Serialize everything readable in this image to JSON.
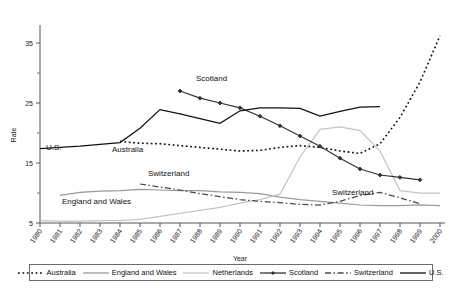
{
  "chart_data": {
    "type": "line",
    "title": "",
    "xlabel": "Year",
    "ylabel": "Rate",
    "xlim": [
      1980,
      2000
    ],
    "ylim": [
      5,
      38
    ],
    "yticks": [
      5,
      15,
      25,
      35
    ],
    "yminor": [
      10,
      20,
      30
    ],
    "grid": false,
    "legend_position": "bottom",
    "x": [
      1980,
      1981,
      1982,
      1983,
      1984,
      1985,
      1986,
      1987,
      1988,
      1989,
      1990,
      1991,
      1992,
      1993,
      1994,
      1995,
      1996,
      1997,
      1998,
      1999,
      2000
    ],
    "series": [
      {
        "name": "Australia",
        "style": "dotted",
        "color": "#111111",
        "marker": "none",
        "x": [
          1984,
          1985,
          1986,
          1987,
          1988,
          1989,
          1990,
          1991,
          1992,
          1993,
          1994,
          1995,
          1996,
          1997,
          1998,
          1999,
          2000
        ],
        "values": [
          18.6,
          18.3,
          18.2,
          17.9,
          17.6,
          17.3,
          17.0,
          17.1,
          17.6,
          17.9,
          17.6,
          17.0,
          16.6,
          18.2,
          22.6,
          28.5,
          36.2
        ]
      },
      {
        "name": "England and Wales",
        "style": "solid",
        "color": "#9a9a9a",
        "marker": "none",
        "x": [
          1981,
          1982,
          1983,
          1984,
          1985,
          1986,
          1987,
          1988,
          1989,
          1990,
          1991,
          1992,
          1993,
          1994,
          1995,
          1996,
          1997,
          1998,
          1999,
          2000
        ],
        "values": [
          9.6,
          10.1,
          10.3,
          10.4,
          10.6,
          10.5,
          10.4,
          10.4,
          10.2,
          10.1,
          9.9,
          9.3,
          8.9,
          8.6,
          8.3,
          8.0,
          7.9,
          7.9,
          8.0,
          7.9
        ]
      },
      {
        "name": "Netherlands",
        "style": "solid",
        "color": "#c4c4c4",
        "marker": "none",
        "x": [
          1980,
          1981,
          1982,
          1983,
          1984,
          1985,
          1986,
          1987,
          1988,
          1989,
          1990,
          1991,
          1992,
          1993,
          1994,
          1995,
          1996,
          1997,
          1998,
          1999,
          2000
        ],
        "values": [
          5.4,
          5.3,
          5.3,
          5.4,
          5.4,
          5.6,
          6.1,
          6.6,
          7.1,
          7.6,
          8.3,
          8.9,
          9.8,
          16.0,
          20.6,
          21.0,
          20.4,
          17.0,
          10.4,
          10.0,
          10.0
        ]
      },
      {
        "name": "Scotland",
        "style": "solid-marker",
        "color": "#333333",
        "marker": "diamond",
        "x": [
          1987,
          1988,
          1989,
          1990,
          1991,
          1992,
          1993,
          1994,
          1995,
          1996,
          1997,
          1998,
          1999
        ],
        "values": [
          27.0,
          25.8,
          25.0,
          24.2,
          22.8,
          21.2,
          19.5,
          17.8,
          15.8,
          14.0,
          13.0,
          12.6,
          12.2
        ]
      },
      {
        "name": "Switzerland",
        "style": "dashdot",
        "color": "#4a4a4a",
        "marker": "none",
        "x": [
          1985,
          1986,
          1987,
          1988,
          1989,
          1990,
          1991,
          1992,
          1993,
          1994,
          1995,
          1996,
          1997,
          1998,
          1999
        ],
        "values": [
          11.5,
          11.0,
          10.5,
          9.9,
          9.4,
          8.9,
          8.6,
          8.4,
          8.1,
          8.0,
          8.6,
          9.6,
          10.1,
          9.2,
          8.2
        ]
      },
      {
        "name": "U.S.",
        "style": "solid",
        "color": "#111111",
        "marker": "none",
        "x": [
          1980,
          1981,
          1982,
          1983,
          1984,
          1985,
          1986,
          1987,
          1988,
          1989,
          1990,
          1991,
          1992,
          1993,
          1994,
          1995,
          1996,
          1997
        ],
        "values": [
          17.4,
          17.6,
          17.8,
          18.1,
          18.4,
          20.8,
          23.9,
          23.2,
          22.4,
          21.6,
          23.7,
          24.2,
          24.2,
          24.1,
          22.8,
          23.6,
          24.3,
          24.4
        ]
      }
    ],
    "annotations": [
      {
        "text": "U.S.",
        "x": 1980.3,
        "y": 17.1
      },
      {
        "text": "Australia",
        "x": 1983.6,
        "y": 16.8
      },
      {
        "text": "Scotland",
        "x": 1987.8,
        "y": 28.6
      },
      {
        "text": "Switzerland",
        "x": 1985.4,
        "y": 12.9
      },
      {
        "text": "Switzerland",
        "x": 1994.6,
        "y": 9.6
      },
      {
        "text": "England and Wales",
        "x": 1981.1,
        "y": 8.2
      }
    ],
    "xtick_labels": [
      "1980",
      "1981",
      "1982",
      "1983",
      "1984",
      "1985",
      "1986",
      "1987",
      "1988",
      "1989",
      "1990",
      "1991",
      "1992",
      "1993",
      "1994",
      "1995",
      "1996",
      "1997",
      "1998",
      "1999",
      "2000"
    ]
  },
  "legend": {
    "entries": [
      {
        "label": "Australia",
        "style": "dotted",
        "color": "#111111"
      },
      {
        "label": "England and Wales",
        "style": "solid",
        "color": "#9a9a9a"
      },
      {
        "label": "Netherlands",
        "style": "solid",
        "color": "#c4c4c4"
      },
      {
        "label": "Scotland",
        "style": "solid-marker",
        "color": "#333333"
      },
      {
        "label": "Switzerland",
        "style": "dashdot",
        "color": "#4a4a4a"
      },
      {
        "label": "U.S.",
        "style": "solid",
        "color": "#111111"
      }
    ]
  }
}
